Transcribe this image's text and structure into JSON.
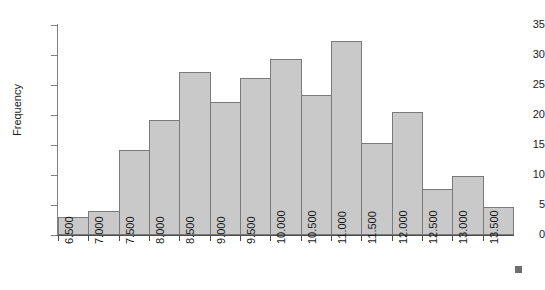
{
  "chart_data": {
    "type": "bar",
    "title": "",
    "subtitle": "",
    "xlabel": "",
    "ylabel": "Frequency",
    "grid": false,
    "legend": null,
    "xlim": [
      6.5,
      14.0
    ],
    "ylim": [
      0,
      35
    ],
    "y_ticks": [
      0,
      5,
      10,
      15,
      20,
      25,
      30,
      35
    ],
    "bin_width": 0.5,
    "categories": [
      "6.500",
      "7.000",
      "7.500",
      "8.000",
      "8.500",
      "9.000",
      "9.500",
      "10.000",
      "10.500",
      "11.000",
      "11.500",
      "12.000",
      "12.500",
      "13.000",
      "13.500"
    ],
    "values": [
      3,
      4,
      14.2,
      19.2,
      27.2,
      22.2,
      26.2,
      29.4,
      23.4,
      32.4,
      15.4,
      20.5,
      7.6,
      9.8,
      4.6
    ],
    "bars": [
      {
        "bin_start": "6.500",
        "value": 3
      },
      {
        "bin_start": "7.000",
        "value": 4
      },
      {
        "bin_start": "7.500",
        "value": 14.2
      },
      {
        "bin_start": "8.000",
        "value": 19.2
      },
      {
        "bin_start": "8.500",
        "value": 27.2
      },
      {
        "bin_start": "9.000",
        "value": 22.2
      },
      {
        "bin_start": "9.500",
        "value": 26.2
      },
      {
        "bin_start": "10.000",
        "value": 29.4
      },
      {
        "bin_start": "10.500",
        "value": 23.4
      },
      {
        "bin_start": "11.000",
        "value": 32.4
      },
      {
        "bin_start": "11.500",
        "value": 15.4
      },
      {
        "bin_start": "12.000",
        "value": 20.5
      },
      {
        "bin_start": "12.500",
        "value": 7.6
      },
      {
        "bin_start": "13.000",
        "value": 9.8
      },
      {
        "bin_start": "13.500",
        "value": 4.6
      }
    ],
    "colors": {
      "bar_fill": "#c9c9c9",
      "bar_border": "#7a7a7a",
      "axis": "#4d4d4d",
      "text": "#1a1a1a",
      "background": "#ffffff",
      "marker": "#6e6e6e"
    }
  }
}
